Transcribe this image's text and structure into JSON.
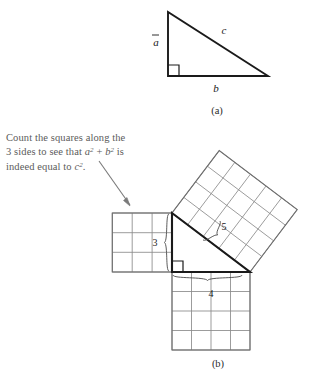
{
  "figure": {
    "panels": [
      {
        "id": "panel-a",
        "label": "(a)",
        "type": "right-triangle",
        "side_labels": {
          "vertical_leg": "a",
          "horizontal_leg": "b",
          "hypotenuse": "c"
        },
        "right_angle_marker": true
      },
      {
        "id": "panel-b",
        "label": "(b)",
        "type": "pythagorean-squares",
        "triangle_sides": {
          "vertical_leg": "3",
          "horizontal_leg": "4",
          "hypotenuse": "5"
        },
        "squares": [
          {
            "name": "square-on-leg-a",
            "side": 3,
            "cells": 9,
            "orientation": "axis-aligned",
            "position": "left"
          },
          {
            "name": "square-on-leg-b",
            "side": 4,
            "cells": 16,
            "orientation": "axis-aligned",
            "position": "bottom"
          },
          {
            "name": "square-on-hypotenuse",
            "side": 5,
            "cells": 25,
            "orientation": "tilted",
            "position": "upper-right"
          }
        ],
        "right_angle_marker": true
      }
    ],
    "annotation": {
      "id": "count-squares-note",
      "line1": "Count the squares along the",
      "line2_pre": "3 sides to see that ",
      "line2_math_a": "a",
      "line2_sup_a": "2",
      "line2_plus": " + ",
      "line2_math_b": "b",
      "line2_sup_b": "2",
      "line2_post": " is",
      "line3_pre": "indeed equal to ",
      "line3_math_c": "c",
      "line3_sup_c": "2",
      "line3_post": ".",
      "has_arrow": true
    },
    "colors": {
      "background": "#ffffff",
      "stroke_dark": "#1a1a1a",
      "grid_line": "#8a8a8a",
      "square_outline": "#6f6f6f",
      "annotation_text": "#5b5b5b",
      "arrow": "#7a7a7a"
    }
  }
}
